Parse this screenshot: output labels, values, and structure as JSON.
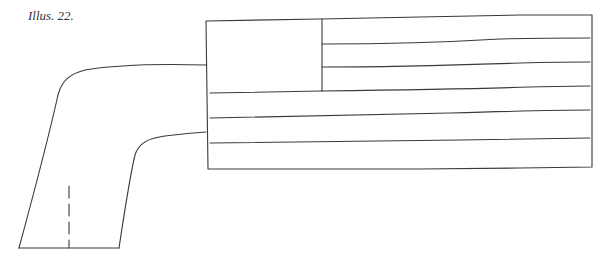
{
  "caption": "Illus. 22.",
  "figure": {
    "stroke_color": "#3a3a3a",
    "background": "#ffffff",
    "flag": {
      "canton": "blank square in upper-left",
      "stripe_lines": 5
    },
    "sleeve": {
      "seam": "dashed line"
    }
  }
}
